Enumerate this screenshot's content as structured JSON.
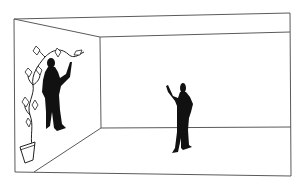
{
  "illustration": {
    "description": "Line drawing of an empty room in perspective with two black silhouette figures",
    "colors": {
      "background": "#ffffff",
      "line": "#5a5a5a",
      "silhouette": "#111111"
    },
    "elements": [
      {
        "name": "room",
        "type": "perspective-box"
      },
      {
        "name": "left-figure",
        "pose": "standing against left wall, right arm raised touching plant"
      },
      {
        "name": "climbing-plant",
        "type": "vine in pot with diamond-shaped leaves"
      },
      {
        "name": "flower-pot",
        "type": "trapezoid pot"
      },
      {
        "name": "right-figure",
        "pose": "standing in room, left arm raised waving"
      }
    ]
  }
}
